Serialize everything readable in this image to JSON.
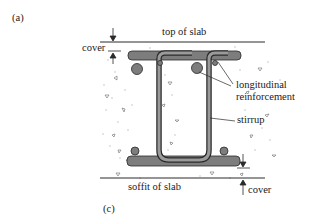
{
  "figure": {
    "panel_label_top": "(a)",
    "panel_label_bottom": "(c)",
    "labels": {
      "top_of_slab": "top of slab",
      "soffit_of_slab": "soffit of slab",
      "cover_top": "cover",
      "cover_bottom": "cover",
      "longitudinal_line1": "longitudinal",
      "longitudinal_line2": "reinforcement",
      "stirrup": "stirrup"
    },
    "colors": {
      "line": "#2a2a2a",
      "bar_fill": "#7d7d7d",
      "stirrup_fill": "#9a9a9a",
      "concrete_speckle": "#b8b8b8"
    }
  }
}
